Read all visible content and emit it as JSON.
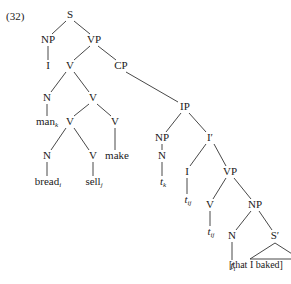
{
  "example_number": "(32)",
  "tree": {
    "nodes": {
      "S": "S",
      "NP_subj": "NP",
      "I_subj": "I",
      "VP_top": "VP",
      "V_top": "V",
      "CP": "CP",
      "N_man": "N",
      "man": "man",
      "man_sub": "k",
      "V_mid": "V",
      "V_left": "V",
      "V_make": "V",
      "make": "make",
      "N_bread": "N",
      "bread": "bread",
      "bread_sub": "i",
      "V_sell": "V",
      "sell": "sell",
      "sell_sub": "j",
      "IP": "IP",
      "NP_ip": "NP",
      "N_tk": "N",
      "tk": "t",
      "tk_sub": "k",
      "Ibar": "I′",
      "I_infl": "I",
      "tij_I": "t",
      "tij_I_sub": "ij",
      "VP_low": "VP",
      "V_low": "V",
      "tij_V": "t",
      "tij_V_sub": "ij",
      "NP_obj": "NP",
      "N_obj": "N",
      "ti": "t",
      "ti_sub": "i",
      "Sbar": "S′",
      "relative_clause": "[that I baked]"
    }
  }
}
